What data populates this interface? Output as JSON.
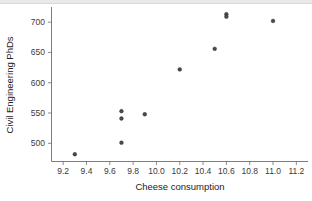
{
  "chart_data": {
    "type": "scatter",
    "title": "",
    "xlabel": "Cheese consumption",
    "ylabel": "Civil Engineering PhDs",
    "xlim": [
      9.1,
      11.3
    ],
    "ylim": [
      470,
      725
    ],
    "xticks": [
      "9.2",
      "9.4",
      "9.6",
      "9.8",
      "10.0",
      "10.2",
      "10.4",
      "10.6",
      "10.8",
      "11.0",
      "11.2"
    ],
    "xtick_values": [
      9.2,
      9.4,
      9.6,
      9.8,
      10.0,
      10.2,
      10.4,
      10.6,
      10.8,
      11.0,
      11.2
    ],
    "yticks": [
      "500",
      "550",
      "600",
      "650",
      "700"
    ],
    "ytick_values": [
      500,
      550,
      600,
      650,
      700
    ],
    "grid": false,
    "legend": false,
    "marker_color": "#4a4a4a",
    "points": [
      {
        "x": 9.3,
        "y": 482
      },
      {
        "x": 9.7,
        "y": 553
      },
      {
        "x": 9.7,
        "y": 541
      },
      {
        "x": 9.7,
        "y": 501
      },
      {
        "x": 9.9,
        "y": 548
      },
      {
        "x": 10.2,
        "y": 622
      },
      {
        "x": 10.5,
        "y": 656
      },
      {
        "x": 10.6,
        "y": 713
      },
      {
        "x": 10.6,
        "y": 709
      },
      {
        "x": 11.0,
        "y": 702
      }
    ]
  }
}
